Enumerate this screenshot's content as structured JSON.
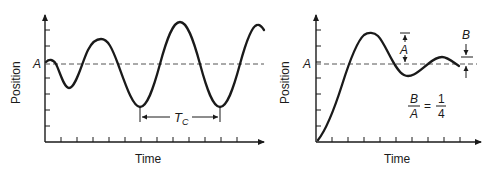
{
  "left_chart": {
    "y_label": "Position",
    "x_label": "Time",
    "reference_label": "A",
    "period_label_main": "T",
    "period_label_sub": "C",
    "description": "Growing oscillation (unstable) about reference A with period Tc"
  },
  "right_chart": {
    "y_label": "Position",
    "x_label": "Time",
    "reference_label": "A",
    "overshoot_label": "A",
    "second_overshoot_label": "B",
    "ratio_numerator_left": "B",
    "ratio_denominator_left": "A",
    "ratio_equals": "=",
    "ratio_numerator_right": "1",
    "ratio_denominator_right": "4",
    "description": "Quarter-amplitude decay response settling at reference A"
  },
  "colors": {
    "ink": "#1a1a1a",
    "dash": "#555555",
    "background": "#ffffff"
  }
}
